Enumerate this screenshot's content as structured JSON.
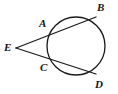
{
  "figure": {
    "type": "geometry-diagram",
    "width": 118,
    "height": 94,
    "background_color": "#ffffff",
    "stroke_color": "#1a1a1a",
    "label_color": "#141414",
    "circle": {
      "center_x": 76,
      "center_y": 46,
      "radius": 29,
      "stroke_width": 1.3
    },
    "external_point": {
      "x": 16,
      "y": 48
    },
    "points": [
      {
        "id": "A",
        "label": "A",
        "x": 52,
        "y": 30,
        "label_x": 39,
        "label_y": 18,
        "role": "near-intersection-upper"
      },
      {
        "id": "B",
        "label": "B",
        "x": 96,
        "y": 17,
        "label_x": 97,
        "label_y": 2,
        "role": "far-intersection-upper"
      },
      {
        "id": "C",
        "label": "C",
        "x": 52,
        "y": 64,
        "label_x": 40,
        "label_y": 62,
        "role": "near-intersection-lower"
      },
      {
        "id": "D",
        "label": "D",
        "x": 96,
        "y": 74,
        "label_x": 95,
        "label_y": 79,
        "role": "far-intersection-lower"
      },
      {
        "id": "E",
        "label": "E",
        "x": 16,
        "y": 48,
        "label_x": 4,
        "label_y": 42,
        "role": "external-vertex"
      }
    ],
    "secants": [
      {
        "id": "EAB",
        "label": "E to B through A",
        "x1": 16,
        "y1": 48,
        "x2": 96,
        "y2": 17,
        "stroke_width": 1.3
      },
      {
        "id": "ECD",
        "label": "E to D through C",
        "x1": 16,
        "y1": 48,
        "x2": 96,
        "y2": 74,
        "stroke_width": 1.3
      }
    ]
  }
}
